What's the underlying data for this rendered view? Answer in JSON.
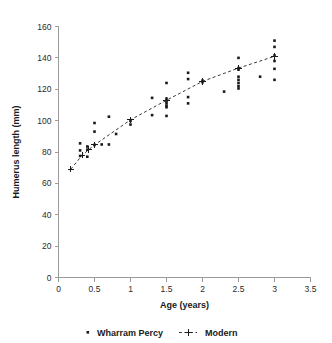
{
  "chart_data": {
    "type": "scatter",
    "title": "",
    "xlabel": "Age (years)",
    "ylabel": "Humerus length (mm)",
    "xlim": [
      0,
      3.5
    ],
    "ylim": [
      0,
      160
    ],
    "xticks": [
      "0",
      "0.5",
      "1",
      "1.5",
      "2",
      "2.5",
      "3",
      "3.5"
    ],
    "xtick_values": [
      0,
      0.5,
      1,
      1.5,
      2,
      2.5,
      3,
      3.5
    ],
    "yticks": [
      "0",
      "20",
      "40",
      "60",
      "80",
      "100",
      "120",
      "140",
      "160"
    ],
    "ytick_values": [
      0,
      20,
      40,
      60,
      80,
      100,
      120,
      140,
      160
    ],
    "grid": false,
    "legend_position": "bottom",
    "series": [
      {
        "name": "Wharram Percy",
        "marker": "dot",
        "style": "scatter",
        "points": [
          [
            0.3,
            85.5
          ],
          [
            0.3,
            81.0
          ],
          [
            0.3,
            77.5
          ],
          [
            0.4,
            83.5
          ],
          [
            0.4,
            81.5
          ],
          [
            0.4,
            77.0
          ],
          [
            0.5,
            98.5
          ],
          [
            0.5,
            93.0
          ],
          [
            0.5,
            84.5
          ],
          [
            0.6,
            84.8
          ],
          [
            0.7,
            102.5
          ],
          [
            0.7,
            84.8
          ],
          [
            0.8,
            91.5
          ],
          [
            1.0,
            99.8
          ],
          [
            1.0,
            97.5
          ],
          [
            1.3,
            114.5
          ],
          [
            1.3,
            103.5
          ],
          [
            1.5,
            124.0
          ],
          [
            1.5,
            114.0
          ],
          [
            1.5,
            112.5
          ],
          [
            1.5,
            111.0
          ],
          [
            1.5,
            109.5
          ],
          [
            1.5,
            108.5
          ],
          [
            1.5,
            103.0
          ],
          [
            1.8,
            130.5
          ],
          [
            1.8,
            126.5
          ],
          [
            1.8,
            115.0
          ],
          [
            1.8,
            111.0
          ],
          [
            2.0,
            125.5
          ],
          [
            2.0,
            124.5
          ],
          [
            2.3,
            118.5
          ],
          [
            2.5,
            140.0
          ],
          [
            2.5,
            133.5
          ],
          [
            2.5,
            132.5
          ],
          [
            2.5,
            128.0
          ],
          [
            2.5,
            126.0
          ],
          [
            2.5,
            124.0
          ],
          [
            2.5,
            122.0
          ],
          [
            2.5,
            120.5
          ],
          [
            2.8,
            128.0
          ],
          [
            3.0,
            151.0
          ],
          [
            3.0,
            147.0
          ],
          [
            3.0,
            141.5
          ],
          [
            3.0,
            138.0
          ],
          [
            3.0,
            133.0
          ],
          [
            3.0,
            126.0
          ]
        ]
      },
      {
        "name": "Modern",
        "marker": "plus",
        "style": "line-dashed",
        "points": [
          [
            0.17,
            69.0
          ],
          [
            0.33,
            78.0
          ],
          [
            0.42,
            81.5
          ],
          [
            0.5,
            84.5
          ],
          [
            1.0,
            100.5
          ],
          [
            1.5,
            113.0
          ],
          [
            2.0,
            125.0
          ],
          [
            2.5,
            133.5
          ],
          [
            3.0,
            141.0
          ]
        ]
      }
    ]
  },
  "legend": {
    "items": [
      {
        "label": "Wharram Percy",
        "marker": "dot"
      },
      {
        "label": "Modern",
        "marker": "plus-line"
      }
    ]
  }
}
